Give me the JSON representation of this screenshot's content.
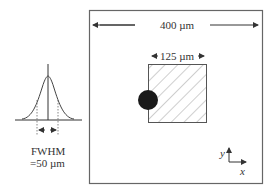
{
  "beam_profile": {
    "label_line1": "FWHM",
    "label_line2": "=50 µm"
  },
  "field": {
    "width_label": "400 µm",
    "inner_width_label": "125 µm"
  },
  "axes": {
    "x_label": "x",
    "y_label": "y"
  },
  "colors": {
    "line": "#555555",
    "spot": "#1a1a1a"
  }
}
